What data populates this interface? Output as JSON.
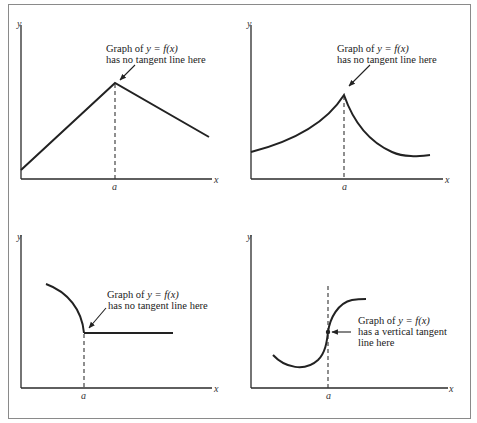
{
  "figure": {
    "panels": [
      {
        "id": "corner",
        "axis_labels": {
          "x": "x",
          "y": "y",
          "tick": "a"
        },
        "annotation": {
          "line1_prefix": "Graph of ",
          "line1_math": "y = f(x)",
          "line2": "has no tangent line here"
        },
        "description": "Piecewise linear function with a corner at x = a"
      },
      {
        "id": "cusp",
        "axis_labels": {
          "x": "x",
          "y": "y",
          "tick": "a"
        },
        "annotation": {
          "line1_prefix": "Graph of ",
          "line1_math": "y = f(x)",
          "line2": "has no tangent line here"
        },
        "description": "Curve with a cusp at x = a"
      },
      {
        "id": "jump",
        "axis_labels": {
          "x": "x",
          "y": "y",
          "tick": "a"
        },
        "annotation": {
          "line1_prefix": "Graph of ",
          "line1_math": "y = f(x)",
          "line2": "has no tangent line here"
        },
        "description": "Curved arc meeting a horizontal segment at x = a"
      },
      {
        "id": "vertical-tangent",
        "axis_labels": {
          "x": "x",
          "y": "y",
          "tick": "a"
        },
        "annotation": {
          "line1_prefix": "Graph of ",
          "line1_math": "y = f(x)",
          "line2": "has a vertical tangent",
          "line3": "line here"
        },
        "description": "S-shaped curve with a vertical tangent at x = a"
      }
    ]
  }
}
